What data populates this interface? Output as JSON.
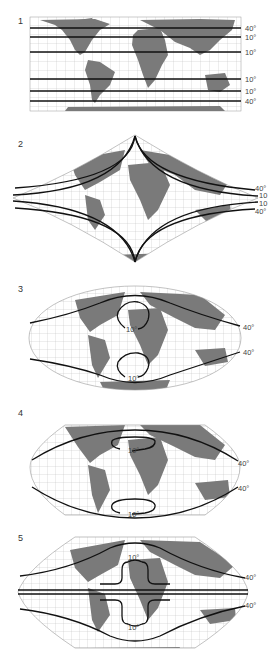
{
  "figure": {
    "type": "map-projection-distortion-comparison",
    "colors": {
      "land": "#7a7a7a",
      "graticule": "#b5b5b5",
      "isoline": "#111111",
      "background": "#ffffff"
    },
    "panels": [
      {
        "number": "1",
        "projection": "cylindrical",
        "labels": [
          "40°",
          "10°",
          "10°",
          "10°",
          "10°",
          "40°"
        ]
      },
      {
        "number": "2",
        "projection": "sinusoidal",
        "labels": [
          "40°",
          "10",
          "10",
          "40°"
        ]
      },
      {
        "number": "3",
        "projection": "mollweide-like",
        "labels": [
          "40°",
          "40°",
          "10°",
          "10°"
        ]
      },
      {
        "number": "4",
        "projection": "pseudocylindrical-flat-pole",
        "labels": [
          "40°",
          "40°",
          "10°",
          "10°"
        ]
      },
      {
        "number": "5",
        "projection": "pseudocylindrical-pointed",
        "labels": [
          "40°",
          "40°",
          "10°",
          "10°"
        ]
      }
    ]
  }
}
